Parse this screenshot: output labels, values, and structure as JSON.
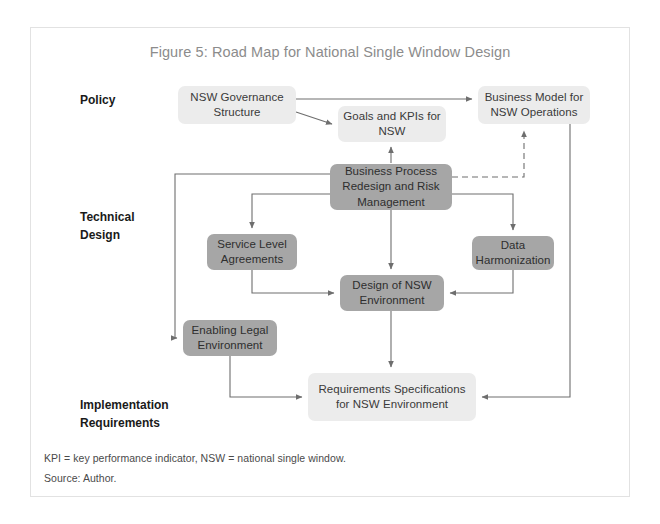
{
  "figure": {
    "title": "Figure 5: Road Map for National Single Window Design",
    "title_color": "#8c8c8c",
    "frame_border_color": "#e2e2e2",
    "background": "#ffffff"
  },
  "palette": {
    "light_box": "#ececec",
    "dark_box": "#a6a6a6",
    "connector": "#6e6e6e",
    "text_dark": "#2e2e2e",
    "label_text": "#1a1a1a"
  },
  "row_labels": [
    {
      "id": "policy",
      "text": "Policy"
    },
    {
      "id": "technical-design",
      "text": "Technical\nDesign"
    },
    {
      "id": "implementation-requirements",
      "text": "Implementation\nRequirements"
    }
  ],
  "nodes": [
    {
      "id": "nsw-governance-structure",
      "label": "NSW Governance Structure",
      "style": "light",
      "x": 178,
      "y": 86,
      "w": 118,
      "h": 38
    },
    {
      "id": "goals-and-kpis",
      "label": "Goals and KPIs for NSW",
      "style": "light",
      "x": 338,
      "y": 106,
      "w": 108,
      "h": 36
    },
    {
      "id": "business-model-nsw-operations",
      "label": "Business Model for NSW Operations",
      "style": "light",
      "x": 478,
      "y": 86,
      "w": 112,
      "h": 38
    },
    {
      "id": "business-process-redesign",
      "label": "Business Process Redesign and Risk Management",
      "style": "dark",
      "x": 330,
      "y": 164,
      "w": 122,
      "h": 46
    },
    {
      "id": "service-level-agreements",
      "label": "Service Level Agreements",
      "style": "dark",
      "x": 207,
      "y": 234,
      "w": 90,
      "h": 36
    },
    {
      "id": "data-harmonization",
      "label": "Data Harmonization",
      "style": "dark",
      "x": 472,
      "y": 236,
      "w": 82,
      "h": 34
    },
    {
      "id": "design-of-nsw-environment",
      "label": "Design of NSW Environment",
      "style": "dark",
      "x": 340,
      "y": 275,
      "w": 104,
      "h": 36
    },
    {
      "id": "enabling-legal-environment",
      "label": "Enabling Legal Environment",
      "style": "dark",
      "x": 183,
      "y": 320,
      "w": 94,
      "h": 36
    },
    {
      "id": "requirements-specifications",
      "label": "Requirements Specifications for NSW Environment",
      "style": "light",
      "x": 308,
      "y": 373,
      "w": 168,
      "h": 48
    }
  ],
  "footnotes": [
    "KPI = key performance indicator, NSW = national single window.",
    "Source: Author."
  ]
}
